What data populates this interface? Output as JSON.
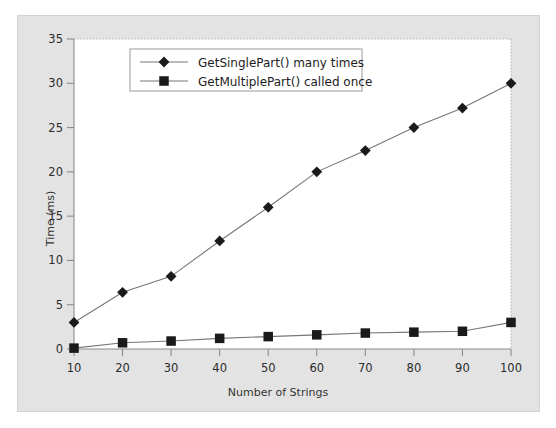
{
  "chart_data": {
    "type": "line",
    "title": "",
    "xlabel": "Number of Strings",
    "ylabel": "Time (ms)",
    "x": [
      10,
      20,
      30,
      40,
      50,
      60,
      70,
      80,
      90,
      100
    ],
    "xticks": [
      "10",
      "20",
      "30",
      "40",
      "50",
      "60",
      "70",
      "80",
      "90",
      "100"
    ],
    "yticks": [
      "0",
      "5",
      "10",
      "15",
      "20",
      "25",
      "30",
      "35"
    ],
    "xlim": [
      10,
      100
    ],
    "ylim": [
      0,
      35
    ],
    "grid": false,
    "legend_position": "upper-left-inside",
    "series": [
      {
        "name": "GetSinglePart() many times",
        "marker": "diamond",
        "color": "#1a1a1a",
        "values": [
          3.0,
          6.4,
          8.2,
          12.2,
          16.0,
          20.0,
          22.4,
          25.0,
          27.2,
          30.0
        ]
      },
      {
        "name": "GetMultiplePart() called once",
        "marker": "square",
        "color": "#1a1a1a",
        "values": [
          0.1,
          0.7,
          0.9,
          1.2,
          1.4,
          1.6,
          1.8,
          1.9,
          2.0,
          3.0
        ]
      }
    ]
  },
  "colors": {
    "panel_background": "#e3e3e3",
    "plot_background": "#ffffff",
    "series_color": "#1a1a1a",
    "axis_color": "#8c8c8c",
    "tick_label_color": "#2b2b2b"
  }
}
